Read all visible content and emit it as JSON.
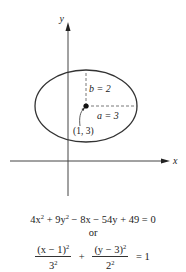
{
  "diagram": {
    "axes": {
      "x_label": "x",
      "y_label": "y"
    },
    "ellipse": {
      "center_label": "(1, 3)",
      "semi_minor_label": "b = 2",
      "semi_major_label": "a = 3",
      "stroke_color": "#333333"
    },
    "equations": {
      "general_form": {
        "t1": "4x",
        "t1_exp": "2",
        "t2": " + 9y",
        "t2_exp": "2",
        "t3": " − 8x − 54y + 49 = 0"
      },
      "connector": "or",
      "standard_form": {
        "num1": "(x − 1)",
        "num1_exp": "2",
        "den1": "3",
        "den1_exp": "2",
        "plus": "+",
        "num2": "(y − 3)",
        "num2_exp": "2",
        "den2": "2",
        "den2_exp": "2",
        "rhs": "= 1"
      }
    }
  }
}
